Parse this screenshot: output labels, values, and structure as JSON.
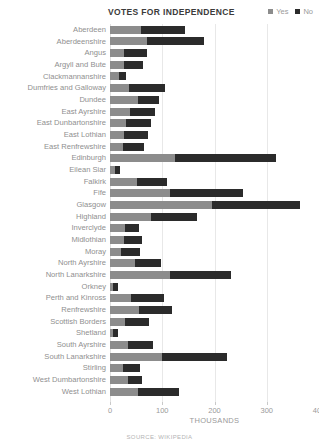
{
  "header": {
    "title": "VOTES FOR INDEPENDENCE"
  },
  "legend": {
    "items": [
      {
        "label": "Yes",
        "color": "#8c8c8c"
      },
      {
        "label": "No",
        "color": "#2b2b2b"
      }
    ]
  },
  "axis": {
    "xlabel": "THOUSANDS",
    "ticks": [
      0,
      100,
      200,
      300,
      400
    ]
  },
  "footer": {
    "source": "SOURCE: WIKIPEDIA"
  },
  "chart_data": {
    "type": "bar",
    "orientation": "horizontal",
    "stacked": true,
    "title": "VOTES FOR INDEPENDENCE",
    "xlabel": "THOUSANDS",
    "ylabel": "",
    "xlim": [
      0,
      400
    ],
    "xticks": [
      0,
      100,
      200,
      300,
      400
    ],
    "grid": true,
    "legend_position": "top-right",
    "units": "thousands of votes",
    "categories": [
      "Aberdeen",
      "Aberdeenshire",
      "Angus",
      "Argyll and Bute",
      "Clackmannanshire",
      "Dumfries and Galloway",
      "Dundee",
      "East Ayrshire",
      "East Dunbartonshire",
      "East Lothian",
      "East Renfrewshire",
      "Edinburgh",
      "Eilean Siar",
      "Falkirk",
      "Fife",
      "Glasgow",
      "Highland",
      "Inverclyde",
      "Midlothian",
      "Moray",
      "North Ayrshire",
      "North Lanarkshire",
      "Orkney",
      "Perth and Kinross",
      "Renfrewshire",
      "Scottish Borders",
      "Shetland",
      "South Ayrshire",
      "South Lanarkshire",
      "Stirling",
      "West Dumbartonshire",
      "West Lothian"
    ],
    "series": [
      {
        "name": "Yes",
        "color": "#8c8c8c",
        "values": [
          59,
          71,
          26,
          26,
          17,
          36,
          53,
          39,
          30,
          27,
          24,
          124,
          10,
          51,
          115,
          195,
          78,
          28,
          27,
          21,
          48,
          115,
          5,
          41,
          55,
          28,
          6,
          34,
          100,
          25,
          34,
          54
        ]
      },
      {
        "name": "No",
        "color": "#2b2b2b",
        "values": [
          85,
          109,
          45,
          37,
          13,
          70,
          40,
          47,
          49,
          45,
          41,
          194,
          10,
          59,
          140,
          169,
          88,
          28,
          34,
          37,
          50,
          116,
          10,
          63,
          63,
          46,
          9,
          48,
          124,
          32,
          28,
          78
        ]
      }
    ]
  }
}
